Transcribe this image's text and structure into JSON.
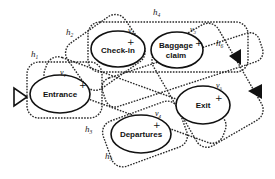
{
  "diagram": {
    "type": "hypergraph",
    "nodes": [
      {
        "id": "v1",
        "symbol": "v",
        "index": "1",
        "label": "Entrance",
        "marker": "+"
      },
      {
        "id": "v2",
        "symbol": "v",
        "index": "2",
        "label": "Check-in",
        "marker": "+"
      },
      {
        "id": "v3",
        "symbol": "v",
        "index": "3",
        "label_line1": "Baggage",
        "label_line2": "claim",
        "marker": "+"
      },
      {
        "id": "v4",
        "symbol": "v",
        "index": "4",
        "label": "Departures",
        "marker": "+"
      },
      {
        "id": "v5",
        "symbol": "v",
        "index": "5",
        "label": "Exit",
        "marker": "+"
      }
    ],
    "hyperedges": [
      {
        "id": "h1",
        "symbol": "h",
        "index": "1"
      },
      {
        "id": "h2",
        "symbol": "h",
        "index": "2"
      },
      {
        "id": "h3",
        "symbol": "h",
        "index": "3"
      },
      {
        "id": "h4",
        "symbol": "h",
        "index": "4"
      },
      {
        "id": "h5",
        "symbol": "h",
        "index": "5"
      },
      {
        "id": "h6",
        "symbol": "h",
        "index": "6"
      }
    ],
    "markers": {
      "entry": "hollow-triangle",
      "exits": [
        "filled-triangle",
        "filled-triangle"
      ]
    },
    "colors": {
      "stroke": "#111111",
      "dotted": "#2a2a2a",
      "background": "#ffffff"
    }
  }
}
